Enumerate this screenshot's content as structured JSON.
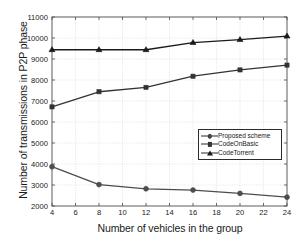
{
  "chart_data": {
    "type": "line",
    "title": "",
    "xlabel": "Number of vehicles in the group",
    "ylabel": "Number of transmissions in P2P phase",
    "x": [
      4,
      8,
      12,
      16,
      20,
      24
    ],
    "xlim": [
      4,
      24
    ],
    "ylim": [
      2000,
      11000
    ],
    "xticks": [
      4,
      6,
      8,
      10,
      12,
      14,
      16,
      18,
      20,
      22,
      24
    ],
    "yticks": [
      2000,
      3000,
      4000,
      5000,
      6000,
      7000,
      8000,
      9000,
      10000,
      11000
    ],
    "xtick_labels": [
      "4",
      "6",
      "8",
      "10",
      "12",
      "14",
      "16",
      "18",
      "20",
      "22",
      "24"
    ],
    "ytick_labels": [
      "2000",
      "3000",
      "4000",
      "5000",
      "6000",
      "7000",
      "8000",
      "9000",
      "10000",
      "11000"
    ],
    "grid": true,
    "legend_position": "center-right",
    "series": [
      {
        "name": "Proposed scheme",
        "marker": "circle",
        "color": "#4d4d4d",
        "values": [
          3870,
          3020,
          2820,
          2760,
          2600,
          2420
        ]
      },
      {
        "name": "CodeOnBasic",
        "marker": "square",
        "color": "#333333",
        "values": [
          6720,
          7440,
          7650,
          8180,
          8480,
          8710
        ]
      },
      {
        "name": "CodeTorrent",
        "marker": "triangle",
        "color": "#1a1a1a",
        "values": [
          9440,
          9440,
          9440,
          9780,
          9920,
          10090
        ]
      }
    ]
  },
  "legend": {
    "items": [
      {
        "label": "Proposed scheme",
        "marker": "circle"
      },
      {
        "label": "CodeOnBasic",
        "marker": "square"
      },
      {
        "label": "CodeTorrent",
        "marker": "triangle"
      }
    ]
  }
}
